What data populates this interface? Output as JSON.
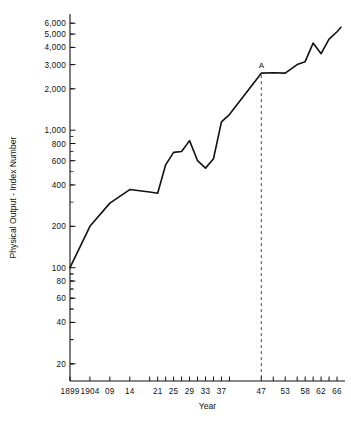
{
  "chart_data": {
    "type": "line",
    "title": "",
    "xlabel": "Year",
    "ylabel": "Physical Output - Index Number",
    "yscale": "log",
    "ylim": [
      15,
      7000
    ],
    "xlim": [
      1899,
      1968
    ],
    "grid": false,
    "legend": null,
    "y_ticks": [
      20,
      40,
      60,
      80,
      100,
      200,
      400,
      600,
      800,
      1000,
      2000,
      3000,
      4000,
      5000,
      6000
    ],
    "y_tick_labels": [
      "20",
      "40",
      "60",
      "80",
      "100",
      "200",
      "400",
      "600",
      "800",
      "1,000",
      "2,000",
      "3,000",
      "4,000",
      "5,000",
      "6,000"
    ],
    "x_ticks": [
      1899,
      1904,
      1909,
      1914,
      1919,
      1921,
      1923,
      1925,
      1927,
      1929,
      1931,
      1933,
      1935,
      1937,
      1939,
      1947,
      1950,
      1953,
      1956,
      1958,
      1960,
      1962,
      1964,
      1966
    ],
    "x_tick_labels": [
      {
        "x": 1899,
        "label": "1899"
      },
      {
        "x": 1904,
        "label": "1904"
      },
      {
        "x": 1909,
        "label": "09"
      },
      {
        "x": 1914,
        "label": "14"
      },
      {
        "x": 1921,
        "label": "21"
      },
      {
        "x": 1925,
        "label": "25"
      },
      {
        "x": 1929,
        "label": "29"
      },
      {
        "x": 1933,
        "label": "33"
      },
      {
        "x": 1937,
        "label": "37"
      },
      {
        "x": 1947,
        "label": "47"
      },
      {
        "x": 1953,
        "label": "53"
      },
      {
        "x": 1958,
        "label": "58"
      },
      {
        "x": 1962,
        "label": "62"
      },
      {
        "x": 1966,
        "label": "66"
      }
    ],
    "x": [
      1899,
      1904,
      1909,
      1914,
      1919,
      1921,
      1923,
      1925,
      1927,
      1929,
      1931,
      1933,
      1935,
      1937,
      1939,
      1947,
      1950,
      1953,
      1956,
      1958,
      1960,
      1962,
      1964,
      1966,
      1967
    ],
    "values": [
      100,
      200,
      295,
      370,
      355,
      348,
      560,
      690,
      700,
      840,
      600,
      530,
      620,
      1150,
      1300,
      2600,
      2620,
      2600,
      3000,
      3150,
      4300,
      3600,
      4600,
      5200,
      5600
    ],
    "annotations": [
      {
        "label": "A",
        "x": 1947,
        "y": 2600,
        "type": "point-marker-with-dashed-vertical-line"
      }
    ],
    "series": [
      {
        "name": "Physical Output Index",
        "color": "#111111",
        "values": [
          100,
          200,
          295,
          370,
          355,
          348,
          560,
          690,
          700,
          840,
          600,
          530,
          620,
          1150,
          1300,
          2600,
          2620,
          2600,
          3000,
          3150,
          4300,
          3600,
          4600,
          5200,
          5600
        ]
      }
    ]
  }
}
